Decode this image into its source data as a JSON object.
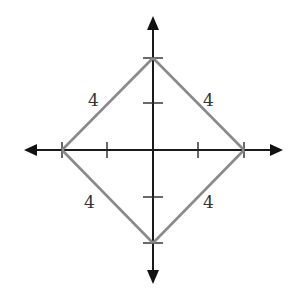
{
  "diagram": {
    "type": "rotated-square-on-axes",
    "colors": {
      "axes": "#1a1a1a",
      "square_sides": "#8a8a8a",
      "labels": "#333333",
      "background": "#ffffff"
    },
    "axes": {
      "x_axis": {
        "arrows": "both",
        "tick_count_each_side": 2
      },
      "y_axis": {
        "arrows": "both",
        "tick_count_each_side": 2
      }
    },
    "vertices": [
      {
        "name": "top",
        "axis": "y",
        "tick_index": 2
      },
      {
        "name": "right",
        "axis": "x",
        "tick_index": 2
      },
      {
        "name": "bottom",
        "axis": "y",
        "tick_index": -2
      },
      {
        "name": "left",
        "axis": "x",
        "tick_index": -2
      }
    ],
    "side_labels": {
      "upper_left": "4",
      "upper_right": "4",
      "lower_left": "4",
      "lower_right": "4"
    }
  }
}
